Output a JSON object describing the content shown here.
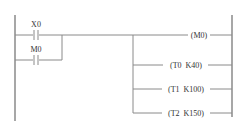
{
  "diagram": {
    "type": "ladder",
    "colors": {
      "line": "#8a8a8a",
      "text": "#333333",
      "background": "#ffffff"
    },
    "contacts": [
      {
        "id": "x0",
        "label": "X0",
        "type": "normally-open"
      },
      {
        "id": "m0",
        "label": "M0",
        "type": "normally-open"
      }
    ],
    "outputs": [
      {
        "id": "m0-coil",
        "label": "(M0)"
      },
      {
        "id": "t0-timer",
        "label": "(T0  K40)"
      },
      {
        "id": "t1-timer",
        "label": "(T1  K100)"
      },
      {
        "id": "t2-timer",
        "label": "(T2  K150)"
      }
    ]
  }
}
